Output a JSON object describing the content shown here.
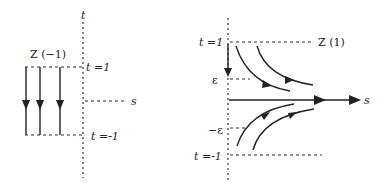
{
  "left_panel": {
    "axis_t_label": "t",
    "axis_s_label": "s",
    "zone_label": "Z (−1)",
    "t_top_label": "t =1",
    "t_bottom_label": "t =-1",
    "flow_lines": 3,
    "flow_direction": "downward"
  },
  "right_panel": {
    "axis_s_label": "s",
    "zone_label": "Z  (1)",
    "t_top_label": "t =1",
    "t_bottom_label": "t =-1",
    "eps_label": "ε",
    "neg_eps_label": "−ε",
    "flow_direction": "converging toward s-axis"
  },
  "colors": {
    "ink": "#222222",
    "background": "#ffffff"
  }
}
